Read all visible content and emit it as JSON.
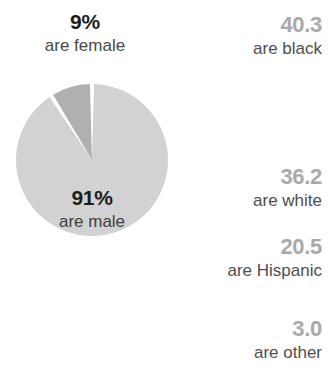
{
  "chart_data": {
    "type": "pie",
    "title": "",
    "categories": [
      "are male",
      "are female"
    ],
    "values": [
      91,
      9
    ],
    "value_labels": [
      "91%",
      "9%"
    ],
    "colors": [
      "#d2d2d2",
      "#b0b0b0"
    ],
    "legend": "none",
    "grid": false
  },
  "pie": {
    "outside_label": {
      "value": "9%",
      "text": "are female"
    },
    "inside_label": {
      "value": "91%",
      "text": "are male"
    },
    "slices": [
      {
        "name": "male-slice",
        "value": "91%",
        "label": "are male",
        "color": "#d2d2d2"
      },
      {
        "name": "female-slice",
        "value": "9%",
        "label": "are female",
        "color": "#b0b0b0"
      }
    ]
  },
  "stats": {
    "items": [
      {
        "value": "40.3",
        "label": "are black"
      },
      {
        "value": "36.2",
        "label": "are white"
      },
      {
        "value": "20.5",
        "label": "are Hispanic"
      },
      {
        "value": "3.0",
        "label": "are other"
      }
    ]
  },
  "colors": {
    "background": "#ffffff",
    "pie_major": "#d2d2d2",
    "pie_minor": "#b0b0b0",
    "stat_value": "#a9a9a9",
    "stat_label": "#4e4e4e",
    "emphasis_text": "#1c1c1c"
  }
}
